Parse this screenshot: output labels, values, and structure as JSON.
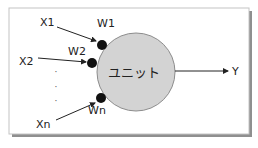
{
  "diagram": {
    "inputs": [
      {
        "label": "X1",
        "weight": "W1"
      },
      {
        "label": "X2",
        "weight": "W2"
      },
      {
        "label": "Xn",
        "weight": "Wn"
      }
    ],
    "ellipsis": "·",
    "unit_label": "ユニット",
    "output_label": "Y",
    "colors": {
      "unit_fill": "#d3d3d3",
      "unit_stroke": "#8c8c8c",
      "weight_dot": "#111111",
      "arrow": "#222222",
      "frame_border": "#bdbdbd",
      "frame_shadow": "#8f8f8f"
    }
  },
  "caption": ""
}
